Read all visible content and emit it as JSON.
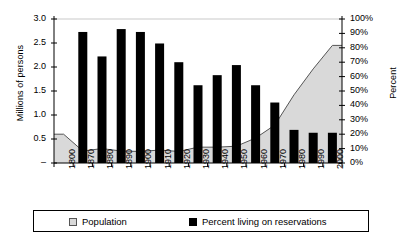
{
  "chart_data": {
    "type": "bar",
    "title": "",
    "xlabel": "",
    "ylabel": "Millions of persons",
    "y2label": "Percent",
    "categories": [
      "1800",
      "1870",
      "1880",
      "1890",
      "1900",
      "1910",
      "1920",
      "1930",
      "1940",
      "1950",
      "1960",
      "1970",
      "1980",
      "1990",
      "2000"
    ],
    "ylim": [
      0,
      3.0
    ],
    "y2lim": [
      0,
      100
    ],
    "yticks": [
      "–",
      "0.5",
      "1.0",
      "1.5",
      "2.0",
      "2.5",
      "3.0"
    ],
    "ytick_values": [
      0,
      0.5,
      1.0,
      1.5,
      2.0,
      2.5,
      3.0
    ],
    "y2ticks": [
      "0%",
      "10%",
      "20%",
      "30%",
      "40%",
      "50%",
      "60%",
      "70%",
      "80%",
      "90%",
      "100%"
    ],
    "y2tick_values": [
      0,
      10,
      20,
      30,
      40,
      50,
      60,
      70,
      80,
      90,
      100
    ],
    "grid": false,
    "legend_position": "bottom",
    "series": [
      {
        "name": "Population",
        "type": "area",
        "axis": "left",
        "color": "#d9d9d9",
        "line_color": "#555555",
        "values": [
          0.6,
          0.25,
          0.3,
          0.25,
          0.24,
          0.27,
          0.24,
          0.33,
          0.33,
          0.35,
          0.52,
          0.79,
          1.42,
          1.96,
          2.45
        ]
      },
      {
        "name": "Percent living on reservations",
        "type": "bar",
        "axis": "right",
        "color": "#000000",
        "values": [
          null,
          91,
          74,
          93,
          91,
          83,
          70,
          54,
          61,
          68,
          54,
          42,
          23,
          21,
          21
        ]
      }
    ]
  },
  "legend": {
    "population_label": "Population",
    "percent_label": "Percent living on reservations"
  }
}
